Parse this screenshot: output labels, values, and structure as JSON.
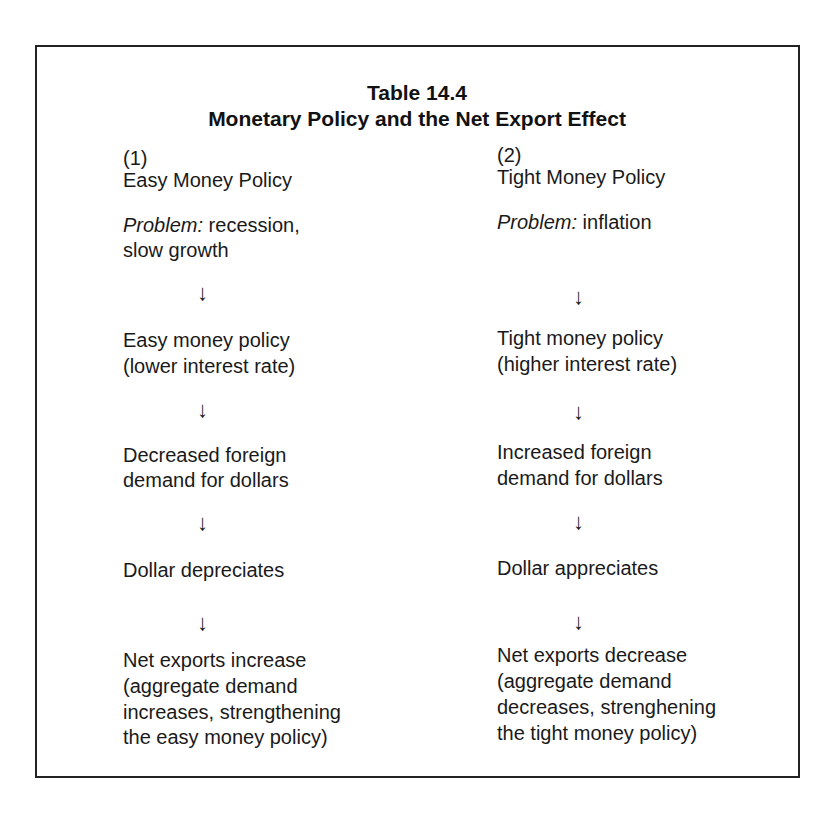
{
  "table": {
    "number": "Table 14.4",
    "title": "Monetary Policy and the Net Export Effect"
  },
  "columns": [
    {
      "index": "(1)",
      "heading": "Easy Money Policy",
      "problem_label": "Problem:",
      "problem_lines": [
        "recession,",
        "slow growth"
      ],
      "steps": [
        [
          "Easy money policy",
          "(lower interest rate)"
        ],
        [
          "Decreased foreign",
          "demand for dollars"
        ],
        [
          "Dollar depreciates"
        ],
        [
          "Net exports increase",
          "(aggregate demand",
          "increases, strengthening",
          "the easy money policy)"
        ]
      ]
    },
    {
      "index": "(2)",
      "heading": "Tight Money Policy",
      "problem_label": "Problem:",
      "problem_lines": [
        "inflation"
      ],
      "steps": [
        [
          "Tight money policy",
          "(higher interest rate)"
        ],
        [
          "Increased foreign",
          "demand for dollars"
        ],
        [
          "Dollar appreciates"
        ],
        [
          "Net exports decrease",
          "(aggregate demand",
          "decreases, strenghening",
          "the tight money policy)"
        ]
      ]
    }
  ],
  "arrow_glyph": "↓",
  "colors": {
    "text": "#1a1a1a",
    "border": "#222222",
    "background": "#ffffff"
  }
}
